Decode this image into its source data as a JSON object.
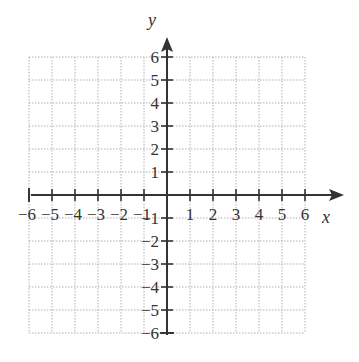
{
  "chart_data": {
    "type": "coordinate-plane",
    "title": "",
    "xlabel": "x",
    "ylabel": "y",
    "xlim": [
      -6,
      6
    ],
    "ylim": [
      -6,
      6
    ],
    "grid": true,
    "grid_style": "dotted",
    "x_ticks": [
      -6,
      -5,
      -4,
      -3,
      -2,
      -1,
      1,
      2,
      3,
      4,
      5,
      6
    ],
    "y_ticks": [
      6,
      5,
      4,
      3,
      2,
      1,
      -1,
      -2,
      -3,
      -4,
      -5,
      -6
    ],
    "x_tick_labels": [
      "−6",
      "−5",
      "−4",
      "−3",
      "−2",
      "−1",
      "1",
      "2",
      "3",
      "4",
      "5",
      "6"
    ],
    "y_tick_labels": [
      "6",
      "5",
      "4",
      "3",
      "2",
      "1",
      "−1",
      "−2",
      "−3",
      "−4",
      "−5",
      "−6"
    ],
    "series": []
  },
  "colors": {
    "axis": "#333333",
    "grid": "#b0b0b0",
    "background": "#ffffff"
  }
}
